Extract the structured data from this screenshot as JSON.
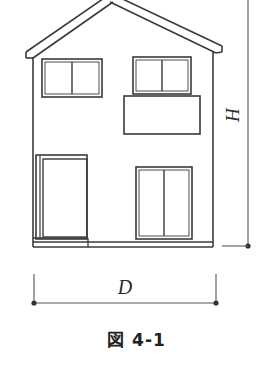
{
  "figure": {
    "caption": "図 4-1",
    "kind": "house-elevation-line-drawing",
    "background_color": "#ffffff",
    "line_color": "#3a3a3a",
    "label_color": "#2b2b2b"
  },
  "dimensions": {
    "height_label": "H",
    "width_label": "D",
    "height_line": {
      "name": "vertical-dimension-line",
      "orientation": "vertical",
      "label_rotation_deg": -90,
      "has_end_dot_bottom": true,
      "has_extension_line_bottom": true
    },
    "width_line": {
      "name": "horizontal-dimension-line",
      "orientation": "horizontal",
      "has_end_dot_left": true,
      "has_end_dot_right": true,
      "has_tick_left": true,
      "has_tick_right": true
    }
  },
  "house": {
    "roof": {
      "name": "gable-roof",
      "style": "double-line-eave",
      "peak_cropped_at_top": true,
      "left_eave_overhang": true,
      "right_eave_overhang": true
    },
    "walls": {
      "name": "front-wall",
      "left_edge_x": 33,
      "right_edge_x": 213
    },
    "openings": [
      {
        "name": "upper-left-window",
        "type": "window",
        "panes": 2,
        "floor": "second"
      },
      {
        "name": "upper-right-window",
        "type": "window",
        "panes": 2,
        "floor": "second"
      },
      {
        "name": "balcony",
        "type": "balcony-rail",
        "panes": 1,
        "floor": "second"
      },
      {
        "name": "entrance-door",
        "type": "door",
        "panes": 1,
        "floor": "first"
      },
      {
        "name": "lower-right-window",
        "type": "sliding-window",
        "panes": 2,
        "floor": "first"
      }
    ],
    "foundation": {
      "name": "foundation-base",
      "has_step": true
    }
  }
}
